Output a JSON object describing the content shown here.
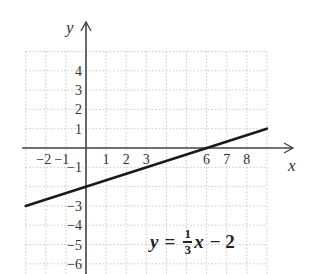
{
  "chart_data": {
    "type": "line",
    "title": "",
    "xlabel": "x",
    "ylabel": "y",
    "xlim": [
      -3,
      9
    ],
    "ylim": [
      -6.5,
      5
    ],
    "grid": true,
    "x_ticks": [
      -2,
      -1,
      1,
      2,
      3,
      6,
      7,
      8
    ],
    "y_ticks": [
      4,
      3,
      2,
      1,
      -1,
      -3,
      -4,
      -5,
      -6
    ],
    "series": [
      {
        "name": "y = (1/3)x - 2",
        "x": [
          -3,
          9
        ],
        "y": [
          -3,
          1
        ],
        "slope": 0.3333,
        "intercept": -2,
        "x_intercept": 6
      }
    ],
    "annotation": {
      "lhs": "y",
      "eq": "=",
      "num": "1",
      "den": "3",
      "var": "x",
      "rest": "− 2"
    }
  },
  "labels": {
    "x_axis": "x",
    "y_axis": "y",
    "x_tick_labels": [
      "−2",
      "−1",
      "1",
      "2",
      "3",
      "6",
      "7",
      "8"
    ],
    "y_tick_labels": [
      "4",
      "3",
      "2",
      "1",
      "−1",
      "−3",
      "−4",
      "−5",
      "−6"
    ]
  },
  "colors": {
    "line": "#1a1a1a",
    "axis": "#444444",
    "grid": "#bbbbbb"
  }
}
